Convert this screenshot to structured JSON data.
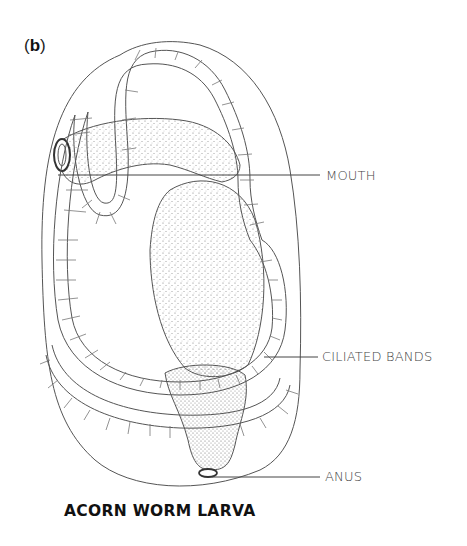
{
  "figure": {
    "panel_label_open": "(",
    "panel_label_letter": "b",
    "panel_label_close": ")",
    "title": "ACORN WORM LARVA",
    "labels": [
      {
        "text": "MOUTH",
        "x": 326,
        "y": 168
      },
      {
        "text": "CILIATED BANDS",
        "x": 322,
        "y": 349
      },
      {
        "text": "ANUS",
        "x": 325,
        "y": 471
      }
    ]
  }
}
